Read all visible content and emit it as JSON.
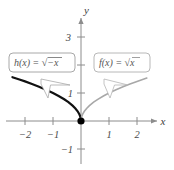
{
  "figure": {
    "background": "#ffffff"
  },
  "axes": {
    "x_axis_label": "x",
    "y_axis_label": "y",
    "x_ticks": [
      {
        "value": -2,
        "label": "−2"
      },
      {
        "value": -1,
        "label": "−1"
      },
      {
        "value": 1,
        "label": "1"
      },
      {
        "value": 2,
        "label": "2"
      }
    ],
    "y_ticks": [
      {
        "value": 3,
        "label": "3"
      },
      {
        "value": 2,
        "label": ""
      },
      {
        "value": 1,
        "label": "1"
      },
      {
        "value": -1,
        "label": "−1"
      }
    ],
    "axis_color": "#8c8c8c",
    "tick_color": "#8c8c8c"
  },
  "callouts": {
    "left": {
      "name": "h",
      "lhs": "h(x)",
      "equals": "=",
      "radical": "√",
      "radicand": "−x",
      "full_text": "h(x) = √−x"
    },
    "right": {
      "name": "f",
      "lhs": "f(x)",
      "equals": "=",
      "radical": "√",
      "radicand": "x",
      "full_text": "f(x) = √x"
    },
    "box_border_color": "#a0a0a0",
    "box_fill": "#ffffff"
  },
  "origin_point": {
    "x": 0,
    "y": 0,
    "color": "#000000",
    "style": "filled-dot"
  },
  "chart_data": {
    "type": "line",
    "title": "",
    "xlabel": "x",
    "ylabel": "y",
    "xlim": [
      -2.7,
      2.45
    ],
    "ylim": [
      -1.55,
      3.7
    ],
    "grid": false,
    "legend": "callout-labels",
    "series": [
      {
        "name": "h(x) = √−x",
        "color": "#111111",
        "width": 2.2,
        "x": [
          -2.45,
          -2.2,
          -2.0,
          -1.75,
          -1.5,
          -1.25,
          -1.0,
          -0.8,
          -0.6,
          -0.45,
          -0.3,
          -0.2,
          -0.12,
          -0.06,
          -0.02,
          0
        ],
        "y": [
          1.565,
          1.483,
          1.414,
          1.323,
          1.225,
          1.118,
          1.0,
          0.894,
          0.775,
          0.671,
          0.548,
          0.447,
          0.346,
          0.245,
          0.141,
          0
        ]
      },
      {
        "name": "f(x) = √x",
        "color": "#a8a8a8",
        "width": 1.6,
        "x": [
          0,
          0.02,
          0.06,
          0.12,
          0.2,
          0.3,
          0.45,
          0.6,
          0.8,
          1.0,
          1.25,
          1.5,
          1.75,
          2.0,
          2.2,
          2.35
        ],
        "y": [
          0,
          0.141,
          0.245,
          0.346,
          0.447,
          0.548,
          0.671,
          0.775,
          0.894,
          1.0,
          1.118,
          1.225,
          1.323,
          1.414,
          1.483,
          1.533
        ]
      }
    ],
    "points": [
      {
        "x": 0,
        "y": 0,
        "label": "",
        "color": "#000000"
      }
    ]
  }
}
